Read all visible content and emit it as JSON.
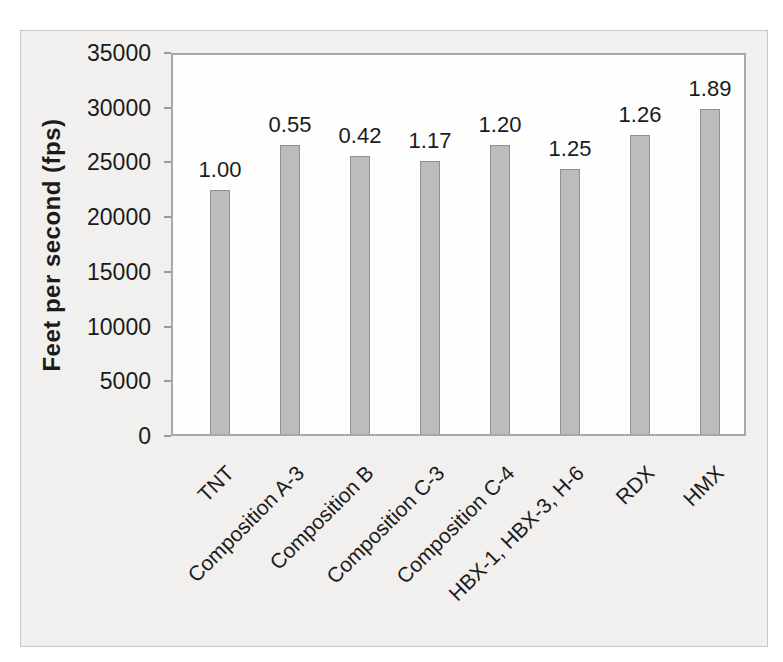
{
  "chart_data": {
    "type": "bar",
    "categories": [
      "TNT",
      "Composition A-3",
      "Composition B",
      "Composition C-3",
      "Composition C-4",
      "HBX-1, HBX-3, H-6",
      "RDX",
      "HMX"
    ],
    "values": [
      22500,
      26600,
      25600,
      25100,
      26600,
      24400,
      27500,
      29900
    ],
    "bar_labels": [
      "1.00",
      "0.55",
      "0.42",
      "1.17",
      "1.20",
      "1.25",
      "1.26",
      "1.89"
    ],
    "title": "",
    "xlabel": "",
    "ylabel": "Feet per second (fps)",
    "ylim": [
      0,
      35000
    ],
    "ytick_step": 5000,
    "ytick_labels": [
      "0",
      "5000",
      "10000",
      "15000",
      "20000",
      "25000",
      "30000",
      "35000"
    ],
    "grid": false,
    "legend_position": "none"
  },
  "colors": {
    "panel_bg": "#f1f0ee",
    "panel_border": "#c9c8c6",
    "plot_bg": "#fefefe",
    "plot_border": "#a8a8a8",
    "bar_fill": "#bcbcbc",
    "bar_dot": "#aaaaaa",
    "bar_border": "#8f8f8f",
    "tick_color": "#9a9a9a",
    "text": "#1b1b1b"
  }
}
